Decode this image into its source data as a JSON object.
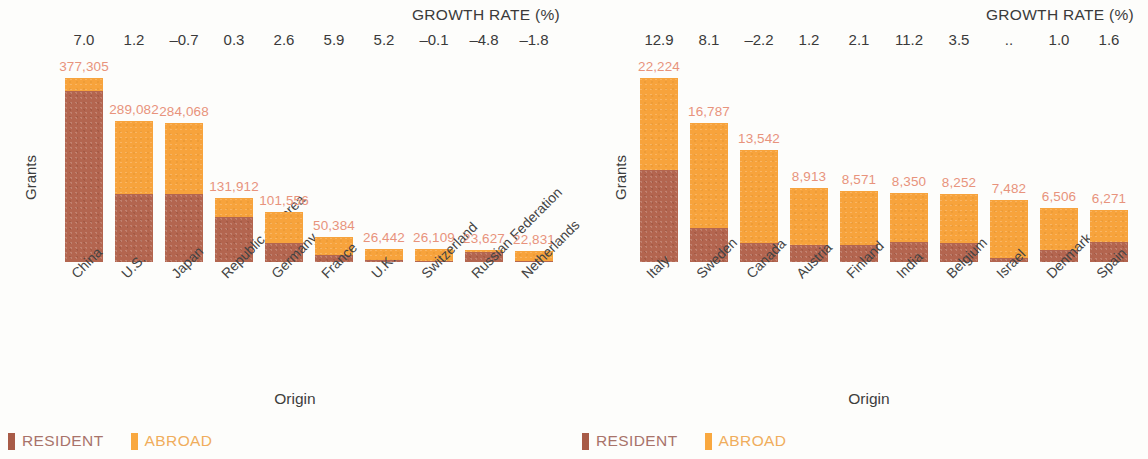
{
  "legend": {
    "resident_label": "RESIDENT",
    "abroad_label": "ABROAD",
    "resident_color": "#a85b47",
    "abroad_color": "#f9a83f"
  },
  "axis": {
    "y_title": "Grants",
    "x_title": "Origin",
    "growth_title": "GROWTH RATE (%)"
  },
  "chart_data": [
    {
      "type": "bar",
      "id": "top-origins",
      "title": "",
      "xlabel": "Origin",
      "ylabel": "Grants",
      "stacked": true,
      "grid": false,
      "legend_position": "bottom-left",
      "categories": [
        "China",
        "U.S.",
        "Japan",
        "Republic of Korea",
        "Germany",
        "France",
        "U.K.",
        "Switzerland",
        "Russian Federation",
        "Netherlands"
      ],
      "totals": [
        377305,
        289082,
        284068,
        131912,
        101556,
        50384,
        26442,
        26109,
        23627,
        22831
      ],
      "total_labels": [
        "377,305",
        "289,082",
        "284,068",
        "131,912",
        "101,556",
        "50,384",
        "26,442",
        "26,109",
        "23,627",
        "22,831"
      ],
      "growth_rates": [
        "7.0",
        "1.2",
        "–0.7",
        "0.3",
        "2.6",
        "5.9",
        "5.2",
        "–0.1",
        "–4.8",
        "–1.8"
      ],
      "series": [
        {
          "name": "RESIDENT",
          "color": "#b3654f",
          "values": [
            350000,
            140000,
            138000,
            92000,
            38000,
            14000,
            3500,
            2500,
            20500,
            3000
          ]
        },
        {
          "name": "ABROAD",
          "color": "#f7a33c",
          "values": [
            27305,
            149082,
            146068,
            39912,
            63556,
            36384,
            22942,
            23609,
            3127,
            19831
          ]
        }
      ],
      "ylim": [
        0,
        400000
      ]
    },
    {
      "type": "bar",
      "id": "next-origins",
      "title": "",
      "xlabel": "Origin",
      "ylabel": "Grants",
      "stacked": true,
      "grid": false,
      "legend_position": "bottom-left",
      "categories": [
        "Italy",
        "Sweden",
        "Canada",
        "Austria",
        "Finland",
        "India",
        "Belgium",
        "Israel",
        "Denmark",
        "Spain"
      ],
      "totals": [
        22224,
        16787,
        13542,
        8913,
        8571,
        8350,
        8252,
        7482,
        6506,
        6271
      ],
      "total_labels": [
        "22,224",
        "16,787",
        "13,542",
        "8,913",
        "8,571",
        "8,350",
        "8,252",
        "7,482",
        "6,506",
        "6,271"
      ],
      "growth_rates": [
        "12.9",
        "8.1",
        "–2.2",
        "1.2",
        "2.1",
        "11.2",
        "3.5",
        "..",
        "1.0",
        "1.6"
      ],
      "series": [
        {
          "name": "RESIDENT",
          "color": "#b3654f",
          "values": [
            11100,
            4100,
            2300,
            2000,
            2100,
            2400,
            2300,
            450,
            1500,
            2400
          ]
        },
        {
          "name": "ABROAD",
          "color": "#f7a33c",
          "values": [
            11124,
            12687,
            11242,
            6913,
            6471,
            5950,
            5952,
            7032,
            5006,
            3871
          ]
        }
      ],
      "ylim": [
        0,
        24000
      ]
    }
  ]
}
